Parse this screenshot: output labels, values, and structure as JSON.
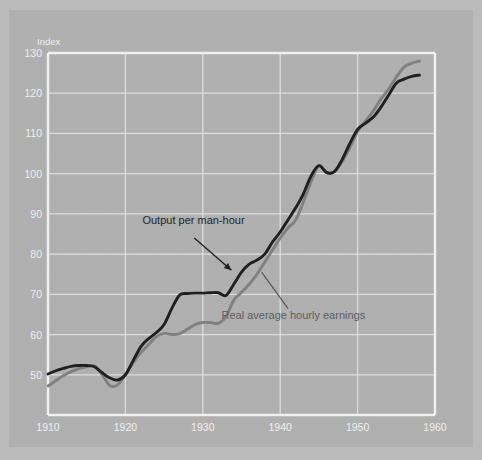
{
  "chart_data": {
    "type": "line",
    "title": "",
    "subtitle": "",
    "xlabel": "",
    "ylabel": "Index",
    "ylim": [
      40,
      130
    ],
    "xlim": [
      1910,
      1960
    ],
    "xticks": [
      1910,
      1920,
      1930,
      1940,
      1950,
      1960
    ],
    "yticks": [
      50,
      60,
      70,
      80,
      90,
      100,
      110,
      120,
      130
    ],
    "grid": true,
    "legend_position": "inline-annotations",
    "background_color": "#b1b1b1",
    "grid_color": "#e8e8e8",
    "axis_label_color": "#f2f2f2",
    "series": [
      {
        "name": "Output per man-hour",
        "color": "#1d1d1d",
        "label_color": "#1d1d1d",
        "x": [
          1910,
          1911,
          1912,
          1913,
          1914,
          1915,
          1916,
          1917,
          1918,
          1919,
          1920,
          1921,
          1922,
          1923,
          1924,
          1925,
          1926,
          1927,
          1928,
          1929,
          1930,
          1931,
          1932,
          1933,
          1934,
          1935,
          1936,
          1937,
          1938,
          1939,
          1940,
          1941,
          1942,
          1943,
          1944,
          1945,
          1946,
          1947,
          1948,
          1949,
          1950,
          1951,
          1952,
          1953,
          1954,
          1955,
          1956,
          1957,
          1958
        ],
        "values": [
          50.2,
          51.0,
          51.6,
          52.1,
          52.3,
          52.3,
          52.0,
          50.5,
          49.2,
          48.7,
          50.0,
          53.5,
          57.0,
          59.0,
          60.5,
          62.5,
          66.5,
          69.8,
          70.2,
          70.3,
          70.3,
          70.4,
          70.4,
          69.7,
          72.5,
          75.5,
          77.5,
          78.5,
          80.0,
          83.0,
          85.5,
          88.5,
          91.5,
          95.0,
          99.5,
          102.0,
          100.3,
          100.5,
          103.5,
          107.5,
          111.0,
          112.5,
          114.0,
          116.5,
          119.5,
          122.5,
          123.5,
          124.2,
          124.5
        ]
      },
      {
        "name": "Real average hourly earnings",
        "color": "#808080",
        "label_color": "#5d5d5d",
        "x": [
          1910,
          1911,
          1912,
          1913,
          1914,
          1915,
          1916,
          1917,
          1918,
          1919,
          1920,
          1921,
          1922,
          1923,
          1924,
          1925,
          1926,
          1927,
          1928,
          1929,
          1930,
          1931,
          1932,
          1933,
          1934,
          1935,
          1936,
          1937,
          1938,
          1939,
          1940,
          1941,
          1942,
          1943,
          1944,
          1945,
          1946,
          1947,
          1948,
          1949,
          1950,
          1951,
          1952,
          1953,
          1954,
          1955,
          1956,
          1957,
          1958
        ],
        "values": [
          47.2,
          48.5,
          49.8,
          50.8,
          51.5,
          52.0,
          52.2,
          50.0,
          47.3,
          47.5,
          50.0,
          53.0,
          55.5,
          57.5,
          59.5,
          60.3,
          60.0,
          60.2,
          61.3,
          62.5,
          63.0,
          63.0,
          62.8,
          64.5,
          68.5,
          70.5,
          72.5,
          75.0,
          78.0,
          81.0,
          84.0,
          86.5,
          88.5,
          93.0,
          98.0,
          102.0,
          100.2,
          100.5,
          103.0,
          106.5,
          110.5,
          113.0,
          115.5,
          118.5,
          121.0,
          124.0,
          126.5,
          127.5,
          128.0
        ]
      }
    ],
    "annotations": [
      {
        "text": "Output per man-hour",
        "text_x": 1928.8,
        "text_y": 87.5,
        "leader_from": [
          1928.9,
          84.0
        ],
        "leader_to": [
          1933.7,
          76.0
        ],
        "color": "#1d1d1d"
      },
      {
        "text": "Real average hourly earnings",
        "text_x": 1941.7,
        "text_y": 63.8,
        "leader_from": [
          1937.6,
          75.5
        ],
        "leader_to": [
          1941.0,
          66.5
        ],
        "color": "#5d5d5d"
      }
    ]
  }
}
